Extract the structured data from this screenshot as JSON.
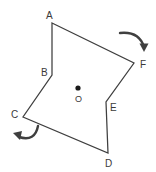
{
  "figure": {
    "stroke_color": "#3f3f3f",
    "label_color": "#3a3a3a",
    "background_color": "#ffffff",
    "center_dot": {
      "name": "center-point-dot",
      "x": 78,
      "y": 88,
      "radius": 2.6,
      "color": "#1a1a1a"
    },
    "center_label": {
      "text": "O",
      "x": 78,
      "y": 99
    },
    "polygon": {
      "name": "polygon-ABCDEF",
      "closed": true,
      "points": "52,23 134,63 106,102 108,153 23,117 52,75",
      "vertices": [
        {
          "label": "A",
          "x": 52,
          "y": 23,
          "label_x": 46,
          "label_y": 11
        },
        {
          "label": "F",
          "x": 134,
          "y": 63,
          "label_x": 140,
          "label_y": 60
        },
        {
          "label": "E",
          "x": 106,
          "y": 102,
          "label_x": 110,
          "label_y": 103
        },
        {
          "label": "D",
          "x": 108,
          "y": 153,
          "label_x": 105,
          "label_y": 159
        },
        {
          "label": "C",
          "x": 23,
          "y": 117,
          "label_x": 11,
          "label_y": 110
        },
        {
          "label": "B",
          "x": 52,
          "y": 75,
          "label_x": 41,
          "label_y": 68
        }
      ]
    },
    "arrows": [
      {
        "name": "rotation-arrow-top-right",
        "direction": "clockwise-down-right",
        "path": "M 120 33 Q 139 31 144 47",
        "head": "144,52 139.5,43.5 148.5,43.5"
      },
      {
        "name": "rotation-arrow-bottom-left",
        "direction": "clockwise-up-left",
        "path": "M 38 126 Q 35 142 19 137",
        "head": "13,133 22,131 20,140"
      }
    ]
  }
}
